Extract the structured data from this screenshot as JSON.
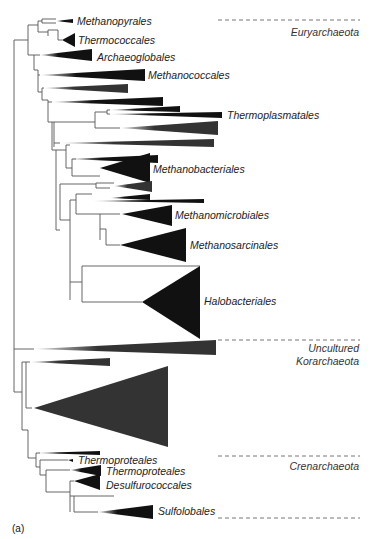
{
  "figure": {
    "panel_label": "(a)",
    "colors": {
      "clade_dark": "#111111",
      "clade_gray": "#333333",
      "branch": "#555555",
      "divider": "#666666"
    },
    "groups": [
      {
        "id": "euryarchaeota",
        "label_lines": [
          "Euryarchaeota"
        ]
      },
      {
        "id": "korarchaeota",
        "label_lines": [
          "Uncultured",
          "Korarchaeota"
        ]
      },
      {
        "id": "crenarchaeota",
        "label_lines": [
          "Crenarchaeota"
        ]
      }
    ],
    "clades": [
      {
        "id": "methanopyrales",
        "label": "Methanopyrales"
      },
      {
        "id": "thermococcales",
        "label": "Thermococcales"
      },
      {
        "id": "archaeoglobales",
        "label": "Archaeoglobales"
      },
      {
        "id": "methanococcales",
        "label": "Methanococcales"
      },
      {
        "id": "thermoplasmatales",
        "label": "Thermoplasmatales"
      },
      {
        "id": "methanobacteriales",
        "label": "Methanobacteriales"
      },
      {
        "id": "methanomicrobiales",
        "label": "Methanomicrobiales"
      },
      {
        "id": "methanosarcinales",
        "label": "Methanosarcinales"
      },
      {
        "id": "halobacteriales",
        "label": "Halobacteriales"
      },
      {
        "id": "thermoproteales-1",
        "label": "Thermoproteales"
      },
      {
        "id": "thermoproteales-2",
        "label": "Thermoproteales"
      },
      {
        "id": "desulfurococcales",
        "label": "Desulfurococcales"
      },
      {
        "id": "sulfolobales",
        "label": "Sulfolobales"
      }
    ]
  }
}
